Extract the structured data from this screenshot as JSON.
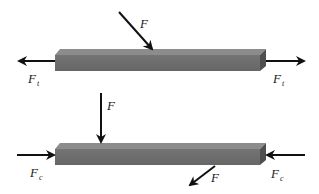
{
  "diagram": {
    "colors": {
      "background": "#ffffff",
      "bar_front": "#6e6e6e",
      "bar_top": "#8a8a8a",
      "bar_end": "#4e4e4e",
      "arrow": "#111111",
      "label": "#1a1a1a"
    },
    "top_case": {
      "name": "tension",
      "applied_force": {
        "symbol": "F",
        "direction": "diagonal-down-right"
      },
      "left_axial": {
        "symbol": "F",
        "subscript": "t",
        "direction": "left"
      },
      "right_axial": {
        "symbol": "F",
        "subscript": "t",
        "direction": "right"
      }
    },
    "bottom_case": {
      "name": "compression",
      "applied_force_top": {
        "symbol": "F",
        "direction": "down"
      },
      "applied_force_bottom": {
        "symbol": "F",
        "direction": "diagonal-down-left"
      },
      "left_axial": {
        "symbol": "F",
        "subscript": "c",
        "direction": "right"
      },
      "right_axial": {
        "symbol": "F",
        "subscript": "c",
        "direction": "left"
      }
    }
  }
}
